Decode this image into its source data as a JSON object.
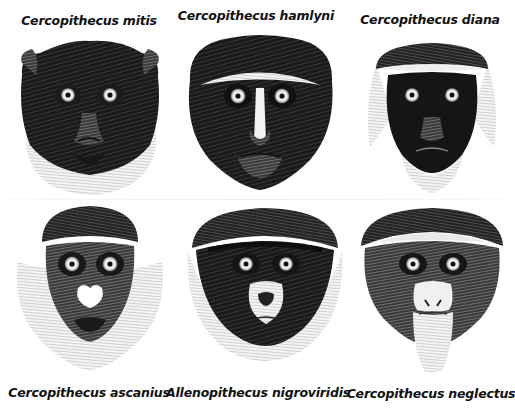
{
  "plate": {
    "title": "Cercopithecus and Allenopithecus head illustrations",
    "ink_color": "#111111",
    "paper_color": "#ffffff",
    "figures": [
      {
        "id": "mitis",
        "label": "Cercopithecus mitis",
        "row": 1,
        "col": 1,
        "label_position": "above"
      },
      {
        "id": "hamlyni",
        "label": "Cercopithecus hamlyni",
        "row": 1,
        "col": 2,
        "label_position": "above"
      },
      {
        "id": "diana",
        "label": "Cercopithecus diana",
        "row": 1,
        "col": 3,
        "label_position": "above"
      },
      {
        "id": "ascanius",
        "label": "Cercopithecus ascanius",
        "row": 2,
        "col": 1,
        "label_position": "below"
      },
      {
        "id": "nigroviridis",
        "label": "Allenopithecus nigroviridis",
        "row": 2,
        "col": 2,
        "label_position": "below"
      },
      {
        "id": "neglectus",
        "label": "Cercopithecus neglectus",
        "row": 2,
        "col": 3,
        "label_position": "below"
      }
    ]
  }
}
